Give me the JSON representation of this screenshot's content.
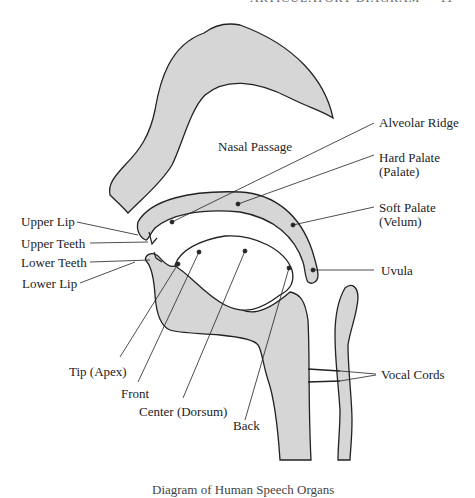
{
  "header": {
    "running_head": "ARTICULATORY DIAGRAM",
    "page_number": "11"
  },
  "diagram": {
    "fill_color": "#d6d6d6",
    "stroke_color": "#222222",
    "labels": {
      "nasal_passage": "Nasal Passage",
      "alveolar_ridge": "Alveolar Ridge",
      "hard_palate": "Hard Palate",
      "hard_palate_alt": "(Palate)",
      "soft_palate": "Soft Palate",
      "soft_palate_alt": "(Velum)",
      "uvula": "Uvula",
      "upper_lip": "Upper Lip",
      "upper_teeth": "Upper Teeth",
      "lower_teeth": "Lower Teeth",
      "lower_lip": "Lower Lip",
      "tip": "Tip (Apex)",
      "front": "Front",
      "center": "Center (Dorsum)",
      "back": "Back",
      "vocal_cords": "Vocal Cords"
    }
  },
  "caption": "Diagram of Human Speech Organs"
}
